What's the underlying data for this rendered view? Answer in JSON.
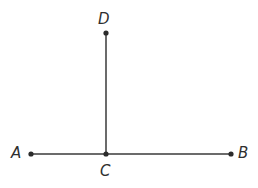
{
  "figure": {
    "type": "geometry-diagram",
    "background_color": "#ffffff",
    "line_color": "#3a3a3a",
    "point_color": "#2b2b2b",
    "label_color": "#2f2f2f",
    "line_width": 1.5,
    "point_radius": 2.6,
    "canvas": {
      "width": 258,
      "height": 188
    },
    "points": [
      {
        "id": "A",
        "label": "A",
        "x": 31,
        "y": 154
      },
      {
        "id": "B",
        "label": "B",
        "x": 231,
        "y": 154
      },
      {
        "id": "C",
        "label": "C",
        "x": 106,
        "y": 154
      },
      {
        "id": "D",
        "label": "D",
        "x": 106,
        "y": 33
      }
    ],
    "segments": [
      {
        "id": "AB",
        "from": "A",
        "to": "B",
        "x1": 31,
        "y1": 154,
        "x2": 231,
        "y2": 154
      },
      {
        "id": "CD",
        "from": "C",
        "to": "D",
        "x1": 106,
        "y1": 154,
        "x2": 106,
        "y2": 33
      }
    ]
  }
}
